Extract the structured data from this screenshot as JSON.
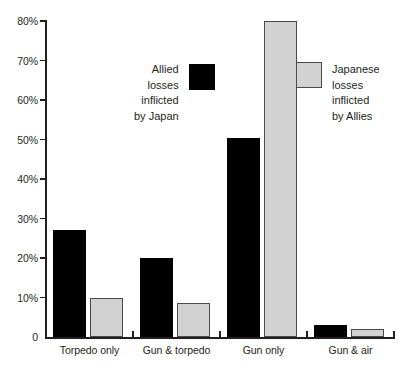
{
  "chart_data": {
    "type": "bar",
    "title": "",
    "xlabel": "",
    "ylabel": "",
    "ylim": [
      0,
      80
    ],
    "grid": false,
    "legend_position": "inside-plot",
    "categories": [
      "Torpedo only",
      "Gun & torpedo",
      "Gun only",
      "Gun & air"
    ],
    "ytick_labels": [
      "0",
      "10%",
      "20%",
      "30%",
      "40%",
      "50%",
      "60%",
      "70%",
      "80%"
    ],
    "ytick_values": [
      0,
      10,
      20,
      30,
      40,
      50,
      60,
      70,
      80
    ],
    "series": [
      {
        "name": "Allied losses inflicted by Japan",
        "color": "#000000",
        "values": [
          27,
          20,
          50.5,
          3
        ]
      },
      {
        "name": "Japanese losses inflicted by Allies",
        "color": "#d2d2d2",
        "values": [
          10,
          8.5,
          80,
          2
        ]
      }
    ]
  },
  "legends": {
    "allied": {
      "lines": [
        "Allied",
        "losses",
        "inflicted",
        "by Japan"
      ],
      "swatch_color": "#000000"
    },
    "japanese": {
      "lines": [
        "Japanese",
        "losses",
        "inflicted",
        "by Allies"
      ],
      "swatch_color": "#d2d2d2"
    }
  }
}
